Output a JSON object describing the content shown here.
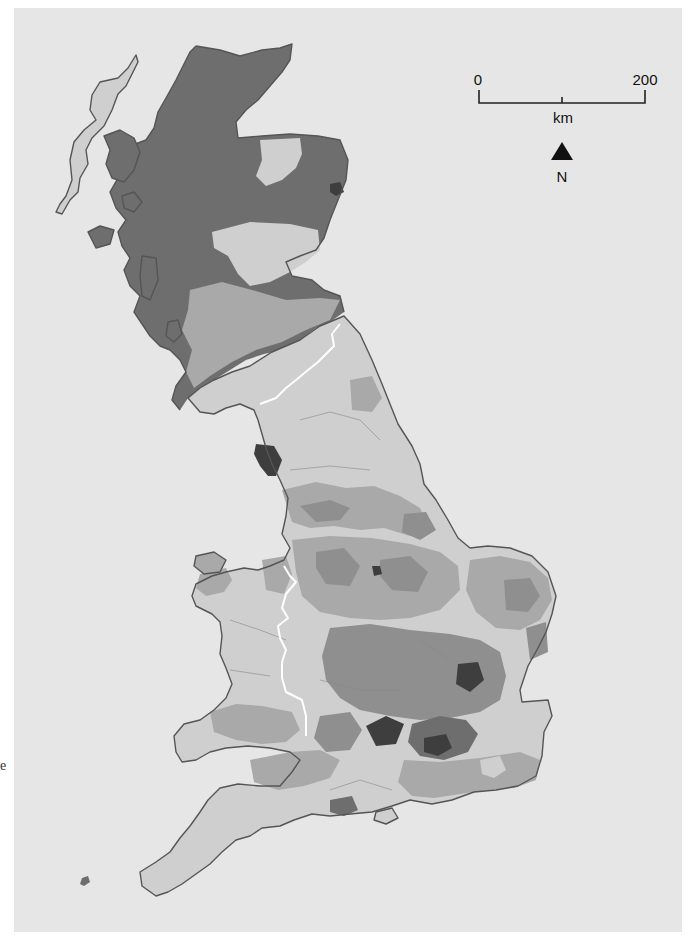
{
  "map": {
    "subject": "Great Britain choropleth map by local authority district",
    "shading": "grayscale, five classes (light to darkest)",
    "colors": {
      "background": "#e6e6e6",
      "class_1_light": "#cfcfcf",
      "class_2_mid": "#a9a9a9",
      "class_3_dark": "#8f8f8f",
      "class_4_darker": "#6e6e6e",
      "class_5_darkest": "#3e3e3e",
      "national_border": "#ffffff",
      "coastline": "#555555"
    },
    "scale_bar": {
      "start_label": "0",
      "end_label": "200",
      "unit": "km"
    },
    "north_arrow": {
      "label": "N"
    },
    "regions": {
      "scotland": "Scotland",
      "england": "England",
      "wales": "Wales"
    }
  },
  "margin_text": {
    "stray_glyph": "e"
  }
}
